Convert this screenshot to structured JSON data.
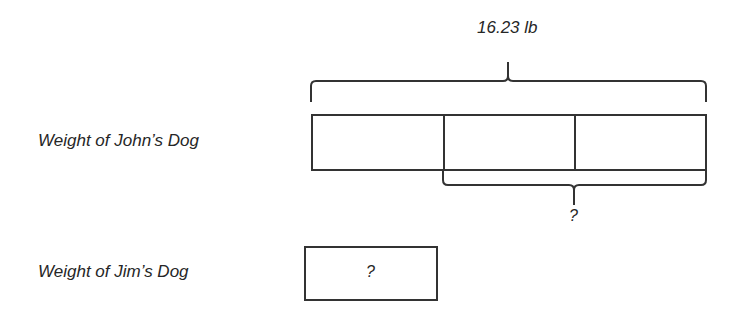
{
  "diagram": {
    "type": "tape-diagram",
    "total_label": "16.23 lb",
    "rows": [
      {
        "label": "Weight of John’s Dog",
        "segments": 3,
        "bracket_label": "?",
        "bracket_spans_segments": [
          2,
          3
        ]
      },
      {
        "label": "Weight of Jim’s Dog",
        "segments": 1,
        "box_label": "?"
      }
    ]
  }
}
